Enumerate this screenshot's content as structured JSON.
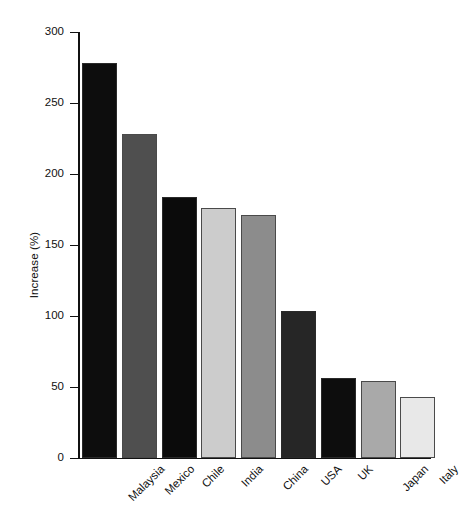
{
  "chart_data": {
    "type": "bar",
    "title": "",
    "xlabel": "",
    "ylabel": "Increase (%)",
    "ylim": [
      0,
      300
    ],
    "yticks": [
      0,
      50,
      100,
      150,
      200,
      250,
      300
    ],
    "grid": false,
    "legend": "none",
    "categories": [
      "Malaysia",
      "Mexico",
      "Chile",
      "India",
      "China",
      "USA",
      "UK",
      "Japan",
      "Italy"
    ],
    "values": [
      278,
      228,
      184,
      176,
      171,
      103,
      56,
      54,
      43
    ],
    "bar_colors": [
      "#0d0d0d",
      "#4f4f4f",
      "#0b0b0b",
      "#cccccc",
      "#8c8c8c",
      "#262626",
      "#0d0d0d",
      "#a9a9a9",
      "#e8e8e8"
    ]
  },
  "axis": {
    "y_title": "Increase (%)",
    "tick_labels": [
      "300",
      "250",
      "200",
      "150",
      "100",
      "50",
      "0"
    ]
  }
}
